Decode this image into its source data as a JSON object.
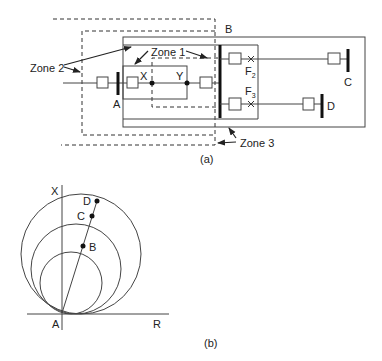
{
  "figure_a": {
    "caption": "(a)",
    "zones": {
      "zone1": "Zone 1",
      "zone2": "Zone 2",
      "zone3": "Zone 3"
    },
    "buses": {
      "A": "A",
      "B": "B",
      "C": "C",
      "D": "D"
    },
    "points": {
      "X": "X",
      "Y": "Y"
    },
    "faults": {
      "F2": {
        "main": "F",
        "sub": "2"
      },
      "F3": {
        "main": "F",
        "sub": "3"
      }
    }
  },
  "figure_b": {
    "caption": "(b)",
    "axes": {
      "vertical": "X",
      "horizontal": "R",
      "origin": "A"
    },
    "points": {
      "B": "B",
      "C": "C",
      "D": "D"
    }
  },
  "colors": {
    "line": "#333333",
    "bus": "#111111",
    "background": "#ffffff"
  }
}
